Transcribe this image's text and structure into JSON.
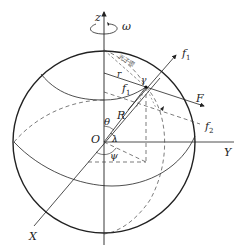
{
  "diagram": {
    "type": "spherical-coordinate-force-diagram",
    "labels": {
      "z_axis": "z",
      "omega": "ω",
      "f1_outer": "f",
      "f1_outer_sub": "1",
      "f1_inner": "f",
      "f1_inner_sub": "1",
      "F": "F",
      "f2": "f",
      "f2_sub": "2",
      "r": "r",
      "R": "R",
      "theta": "θ",
      "O": "O",
      "lambda": "λ",
      "psi": "ψ",
      "Y_axis": "Y",
      "X_axis": "X",
      "point": "γ",
      "annotation_cjk": "光子密"
    },
    "colors": {
      "stroke": "#222222",
      "dashed": "#444444",
      "background": "#ffffff"
    }
  }
}
